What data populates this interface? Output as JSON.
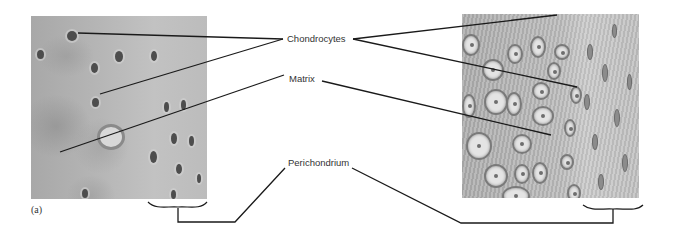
{
  "figure": {
    "panel_label": "(a)",
    "left_panel": "light-micrograph-hyaline-cartilage",
    "right_panel": "illustration-hyaline-cartilage"
  },
  "labels": {
    "chondrocytes": "Chondrocytes",
    "matrix": "Matrix",
    "perichondrium": "Perichondrium"
  },
  "colors": {
    "leader_line": "#1a1a1a",
    "label_text": "#333333",
    "tissue_gray": "#b6b6b6"
  }
}
